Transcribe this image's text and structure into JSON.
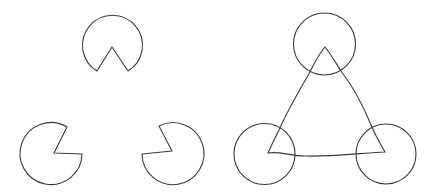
{
  "colors": {
    "stroke": "#3a3a3a",
    "background": "#ffffff"
  },
  "panels": [
    {
      "id": "inducers",
      "description": "Three pac-man inducers arranged at the corners of an implied triangle",
      "shapes": [
        {
          "kind": "pacman",
          "position": "top",
          "mouth_direction": "down"
        },
        {
          "kind": "pacman",
          "position": "bottom-left",
          "mouth_direction": "up-right"
        },
        {
          "kind": "pacman",
          "position": "bottom-right",
          "mouth_direction": "up-left"
        }
      ]
    },
    {
      "id": "explained",
      "description": "Full circles with the perceived illusory triangle outlined",
      "shapes": [
        {
          "kind": "circle",
          "position": "top"
        },
        {
          "kind": "circle",
          "position": "bottom-left"
        },
        {
          "kind": "circle",
          "position": "bottom-right"
        },
        {
          "kind": "triangle",
          "sides": 3,
          "curved_edges": true
        }
      ]
    }
  ]
}
